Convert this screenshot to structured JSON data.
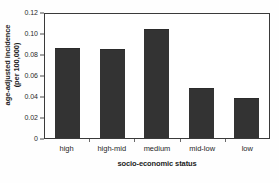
{
  "chart_data": {
    "type": "bar",
    "title": "",
    "subtitle": "",
    "categories": [
      "high",
      "high-mid",
      "medium",
      "mid-low",
      "low"
    ],
    "values": [
      0.0855,
      0.0845,
      0.104,
      0.048,
      0.0385
    ],
    "xlabel": "socio-economic status",
    "ylabel_line1": "age-adjusted incidence",
    "ylabel_line2": "(per 100,000)",
    "ylim": [
      0,
      0.12
    ],
    "yticks": [
      "0",
      "0.02",
      "0.04",
      "0.06",
      "0.08",
      "0.10",
      "0.12"
    ],
    "ytick_values": [
      0,
      0.02,
      0.04,
      0.06,
      0.08,
      0.1,
      0.12
    ],
    "grid": "none",
    "legend": "none",
    "bar_color": "#333333",
    "frame_color": "#3a3a3a",
    "background": "#ffffff"
  }
}
